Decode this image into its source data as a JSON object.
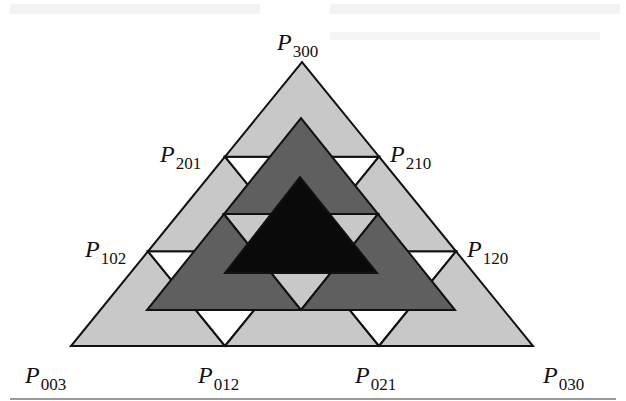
{
  "figure": {
    "colors": {
      "outer_fill": "#c8c8c8",
      "middle_fill": "#5f5f5f",
      "inner_fill": "#0a0a0a",
      "gap_fill": "#ffffff",
      "stroke": "#111111",
      "rule": "#9a9a9a"
    },
    "outer_triangle": {
      "vertices": [
        [
          71,
          346
        ],
        [
          533,
          346
        ],
        [
          302,
          62
        ]
      ],
      "subdivision": 3
    },
    "middle_triangle": {
      "vertices": [
        [
          147,
          310
        ],
        [
          455,
          310
        ],
        [
          301,
          118
        ]
      ],
      "subdivision": 2
    },
    "inner_triangle": {
      "vertices": [
        [
          225,
          273
        ],
        [
          377,
          273
        ],
        [
          300,
          177
        ]
      ],
      "subdivision": 1
    },
    "labels": [
      {
        "id": "P300",
        "letter": "P",
        "sub": "300",
        "x": 277,
        "y": 50
      },
      {
        "id": "P201",
        "letter": "P",
        "sub": "201",
        "x": 160,
        "y": 162
      },
      {
        "id": "P210",
        "letter": "P",
        "sub": "210",
        "x": 390,
        "y": 162
      },
      {
        "id": "P102",
        "letter": "P",
        "sub": "102",
        "x": 85,
        "y": 257
      },
      {
        "id": "P120",
        "letter": "P",
        "sub": "120",
        "x": 467,
        "y": 257
      },
      {
        "id": "P003",
        "letter": "P",
        "sub": "003",
        "x": 25,
        "y": 383
      },
      {
        "id": "P012",
        "letter": "P",
        "sub": "012",
        "x": 198,
        "y": 383
      },
      {
        "id": "P021",
        "letter": "P",
        "sub": "021",
        "x": 355,
        "y": 383
      },
      {
        "id": "P030",
        "letter": "P",
        "sub": "030",
        "x": 543,
        "y": 383
      }
    ]
  }
}
